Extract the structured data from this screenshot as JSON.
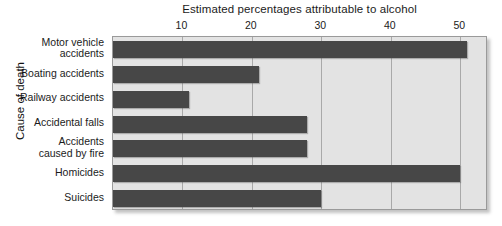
{
  "chart_data": {
    "type": "bar",
    "orientation": "horizontal",
    "title": "Estimated percentages attributable to alcohol",
    "xlabel": "",
    "ylabel": "Cause of death",
    "xlim": [
      0,
      54
    ],
    "xticks": [
      10,
      20,
      30,
      40,
      50
    ],
    "xtick_labels": [
      "10",
      "20",
      "30",
      "40",
      "50"
    ],
    "grid": "vertical",
    "legend": "none",
    "categories": [
      "Motor vehicle\naccidents",
      "Boating accidents",
      "Railway accidents",
      "Accidental falls",
      "Accidents\ncaused by fire",
      "Homicides",
      "Suicides"
    ],
    "values": [
      51,
      21,
      11,
      28,
      28,
      50,
      30
    ],
    "bar_color": "#474747",
    "plot_background": "#e3e3e3",
    "gridline_color": "#a9a9a9",
    "border_color": "#9a9a9a"
  }
}
